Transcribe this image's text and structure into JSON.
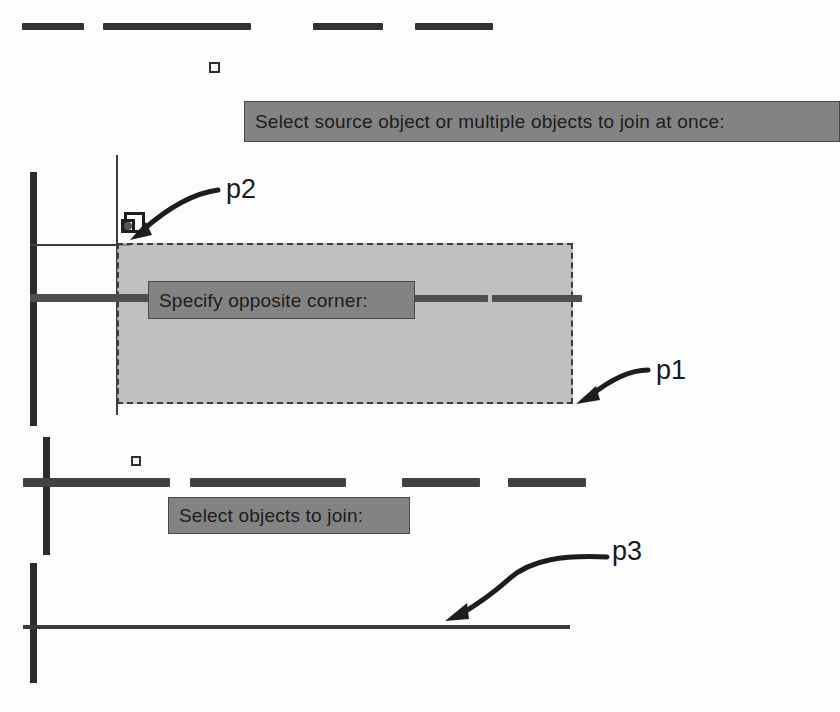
{
  "figure": {
    "background_color": "#fdfdfd",
    "line_color": "#2b2b2b",
    "prompt_fill": "#838383",
    "prompt_border": "#4a4a4a",
    "selection_fill": "#a8a8a8",
    "selection_border": "#3d3d3d"
  },
  "prompts": {
    "source": {
      "text": "Select source object or multiple objects to join at once:",
      "x": 244,
      "y": 101,
      "width": 596,
      "height": 41,
      "font_size": 19
    },
    "opposite_corner": {
      "text": "Specify opposite corner:",
      "x": 148,
      "y": 281,
      "width": 267,
      "height": 38,
      "font_size": 19
    },
    "objects_to_join": {
      "text": "Select objects to join:",
      "x": 168,
      "y": 497,
      "width": 242,
      "height": 37,
      "font_size": 19
    }
  },
  "callouts": [
    {
      "label": "p2",
      "x": 226,
      "y": 176
    },
    {
      "label": "p1",
      "x": 656,
      "y": 357
    },
    {
      "label": "p3",
      "x": 612,
      "y": 538
    }
  ],
  "selection_window": {
    "x": 117,
    "y": 243,
    "width": 456,
    "height": 161
  },
  "top_dashes": {
    "y": 23,
    "height": 7,
    "segments": [
      {
        "x": 22,
        "width": 62
      },
      {
        "x": 103,
        "width": 148
      },
      {
        "x": 313,
        "width": 70
      },
      {
        "x": 415,
        "width": 78
      }
    ]
  },
  "middle_dashes": {
    "y": 478,
    "height": 9,
    "segments": [
      {
        "x": 23,
        "width": 147
      },
      {
        "x": 190,
        "width": 156
      },
      {
        "x": 402,
        "width": 78
      },
      {
        "x": 508,
        "width": 78
      }
    ]
  },
  "middle_row_dashes": {
    "y": 294,
    "height": 8,
    "segments": [
      {
        "x": 30,
        "width": 384
      },
      {
        "x": 414,
        "width": 74
      },
      {
        "x": 492,
        "width": 90
      }
    ]
  },
  "lines": {
    "upper_vertical_thick": {
      "x": 30,
      "y": 172,
      "width": 7,
      "height": 254
    },
    "upper_vertical_thin": {
      "x": 116,
      "y": 155,
      "width": 2,
      "height": 260
    },
    "upper_horizontal_thin": {
      "x": 30,
      "y": 244,
      "width": 100,
      "height": 2
    },
    "middle_vertical_thick": {
      "x": 43,
      "y": 437,
      "width": 7,
      "height": 118
    },
    "bottom_vertical_thick": {
      "x": 30,
      "y": 563,
      "width": 7,
      "height": 120
    },
    "bottom_horizontal_thin": {
      "x": 23,
      "y": 625,
      "width": 547,
      "height": 4
    }
  },
  "markers": {
    "top_pickbox": {
      "x": 209,
      "y": 62,
      "size": 11,
      "name": "pickbox-cursor-top"
    },
    "middle_pickbox": {
      "x": 131,
      "y": 456,
      "size": 10,
      "name": "pickbox-cursor-middle"
    },
    "osnap_box": {
      "x": 124,
      "y": 212,
      "size": 21,
      "name": "osnap-marker"
    },
    "osnap_inner": {
      "x": 122,
      "y": 219,
      "size": 13,
      "name": "osnap-inner-marker"
    }
  },
  "arrows": {
    "p2": {
      "name": "arrow-to-p2"
    },
    "p1": {
      "name": "arrow-to-p1"
    },
    "p3": {
      "name": "arrow-to-p3"
    }
  }
}
